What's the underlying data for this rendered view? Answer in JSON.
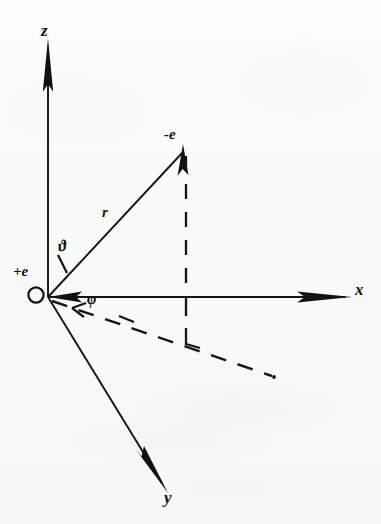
{
  "figure": {
    "background_color": "#fbfbfa",
    "ink_color": "#111111"
  },
  "axes": {
    "z": {
      "label": "z",
      "direction": "up",
      "arrow": "solid-triangle"
    },
    "x": {
      "label": "x",
      "direction": "right",
      "arrow": "solid-triangle"
    },
    "y": {
      "label": "y",
      "direction": "down-right",
      "arrow": "solid-triangle"
    }
  },
  "points": {
    "origin_charge": {
      "label": "+e",
      "marker": "open-circle",
      "position_note": "at coordinate origin"
    },
    "field_charge": {
      "label": "-e",
      "marker": "arrow-tip",
      "position_note": "end of position vector r"
    }
  },
  "vectors": {
    "r": {
      "label": "r",
      "from": "+e",
      "to": "-e",
      "style": "solid-arrow"
    }
  },
  "angles": {
    "polar": {
      "label": "ϑ",
      "name": "vartheta",
      "measured_from": "z-axis",
      "marker": "angle-tick"
    },
    "azimuthal": {
      "label": "φ",
      "name": "phi",
      "measured_from": "x-axis",
      "marker": "angle-tick"
    }
  },
  "construction_lines": {
    "vertical_drop": {
      "style": "dashed",
      "description": "perpendicular from -e down to the x-y plane"
    },
    "azimuthal_projection": {
      "style": "dashed",
      "description": "projection of r onto the x-y plane from the origin"
    },
    "right_angle_marker": {
      "style": "solid",
      "description": "right-angle symbol at foot of perpendicular"
    }
  }
}
